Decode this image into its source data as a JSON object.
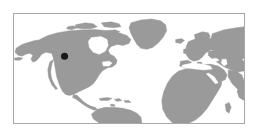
{
  "figure": {
    "type": "locator-map",
    "background_color": "#ffffff"
  },
  "map": {
    "projection": "equirectangular",
    "frame": {
      "border_color": "#a8a8a8",
      "border_width_px": 1,
      "x_px": 13,
      "y_px": 13,
      "width_px": 232,
      "height_px": 111
    },
    "ocean_color": "#ffffff",
    "land_color": "#9a9a9a",
    "land_stroke_color": "#9a9a9a",
    "lon_range": [
      -170,
      152
    ],
    "lat_range": [
      -22,
      84
    ],
    "grid": false,
    "labels_visible": false,
    "continents_visible": [
      "North America",
      "Greenland",
      "Central America",
      "South America",
      "Europe",
      "Africa",
      "Asia"
    ]
  },
  "markers": [
    {
      "name": "location-marker",
      "label": "",
      "color": "#1a1a1a",
      "shape": "circle",
      "radius_px": 3.6,
      "x_px": 64,
      "y_px": 56,
      "lon": -121.5,
      "lat": 46.5,
      "region": "Pacific Northwest, North America"
    }
  ],
  "legend": {
    "visible": false,
    "entries": []
  },
  "chart_data": {
    "type": "map",
    "title": "",
    "xlabel": "",
    "ylabel": "",
    "xlim": [
      -170,
      152
    ],
    "ylim": [
      -22,
      84
    ],
    "grid": false,
    "series": [
      {
        "name": "study-site",
        "values": [
          {
            "lon": -121.5,
            "lat": 46.5
          }
        ]
      }
    ]
  }
}
